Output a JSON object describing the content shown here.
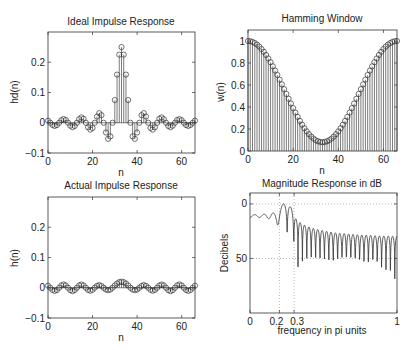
{
  "figure": {
    "panels": [
      {
        "title": "Ideal Impulse Response",
        "xlabel": "n",
        "ylabel": "hd(n)"
      },
      {
        "title": "Hamming Window",
        "xlabel": "n",
        "ylabel": "w(n)"
      },
      {
        "title": "Actual Impulse Response",
        "xlabel": "n",
        "ylabel": "h(n)"
      },
      {
        "title": "Magnitude Response in dB",
        "xlabel": "frequency in pi units",
        "ylabel": "Decibels"
      }
    ]
  },
  "chart_data": [
    {
      "type": "stem",
      "title": "Ideal Impulse Response",
      "xlabel": "n",
      "ylabel": "hd(n)",
      "xlim": [
        0,
        66
      ],
      "ylim": [
        -0.1,
        0.3
      ],
      "xticks": [
        0,
        20,
        40,
        60
      ],
      "yticks": [
        -0.1,
        0,
        0.1,
        0.2
      ],
      "ytick_labels": [
        "−0.1",
        "0",
        "0.1",
        "0.2"
      ],
      "x_range": [
        0,
        66
      ],
      "half_values_k0_to_33": [
        0.25,
        0.2251,
        0.1592,
        0.075,
        0,
        -0.045,
        -0.0531,
        -0.0322,
        0,
        0.025,
        0.0318,
        0.0205,
        0,
        -0.0173,
        -0.0227,
        -0.015,
        0,
        0.0132,
        0.0177,
        0.0118,
        0,
        -0.0107,
        -0.0145,
        -0.0098,
        0,
        0.009,
        0.0122,
        0.0083,
        0,
        -0.0078,
        -0.0106,
        -0.0073,
        0,
        0.0068
      ],
      "center": 33
    },
    {
      "type": "stem",
      "title": "Hamming Window",
      "xlabel": "n",
      "ylabel": "w(n)",
      "xlim": [
        0,
        66
      ],
      "ylim": [
        0,
        1.1
      ],
      "xticks": [
        0,
        20,
        40,
        60
      ],
      "yticks": [
        0,
        0.2,
        0.4,
        0.6,
        0.8,
        1
      ],
      "ytick_labels": [
        "0",
        "0.2",
        "0.4",
        "0.6",
        "0.8",
        "1"
      ],
      "half_values_n0_to_33": [
        0.08,
        0.0821,
        0.0883,
        0.0986,
        0.1129,
        0.1312,
        0.153,
        0.1784,
        0.2071,
        0.2388,
        0.2732,
        0.31,
        0.3489,
        0.3895,
        0.4315,
        0.4745,
        0.5181,
        0.5619,
        0.6055,
        0.6485,
        0.6905,
        0.7311,
        0.77,
        0.8068,
        0.8412,
        0.8729,
        0.9016,
        0.927,
        0.9488,
        0.9671,
        0.9814,
        0.9917,
        0.9979,
        1.0
      ],
      "center": 33
    },
    {
      "type": "stem",
      "title": "Actual Impulse Response",
      "xlabel": "n",
      "ylabel": "h(n)",
      "xlim": [
        0,
        66
      ],
      "ylim": [
        -0.1,
        0.3
      ],
      "xticks": [
        0,
        20,
        40,
        60
      ],
      "yticks": [
        -0.1,
        0,
        0.1,
        0.2
      ],
      "ytick_labels": [
        "−0.1",
        "0",
        "0.1",
        "0.2"
      ],
      "note": "h(n) = hd(n) * w(n)"
    },
    {
      "type": "line",
      "title": "Magnitude Response in dB",
      "xlabel": "frequency in pi units",
      "ylabel": "Decibels",
      "xlim": [
        0,
        1
      ],
      "ylim": [
        -100,
        10
      ],
      "xticks": [
        0,
        0.2,
        0.3,
        1
      ],
      "xtick_labels": [
        "0",
        "0.2",
        "0.3",
        "1"
      ],
      "yticks": [
        0,
        -50
      ],
      "ytick_labels": [
        "0",
        "50"
      ],
      "grid_x": [
        0.2,
        0.3
      ],
      "grid_y": [
        0,
        -50
      ],
      "passband_edge": 0.2,
      "stopband_edge": 0.3,
      "min_stopband_attenuation_db": 52
    }
  ]
}
